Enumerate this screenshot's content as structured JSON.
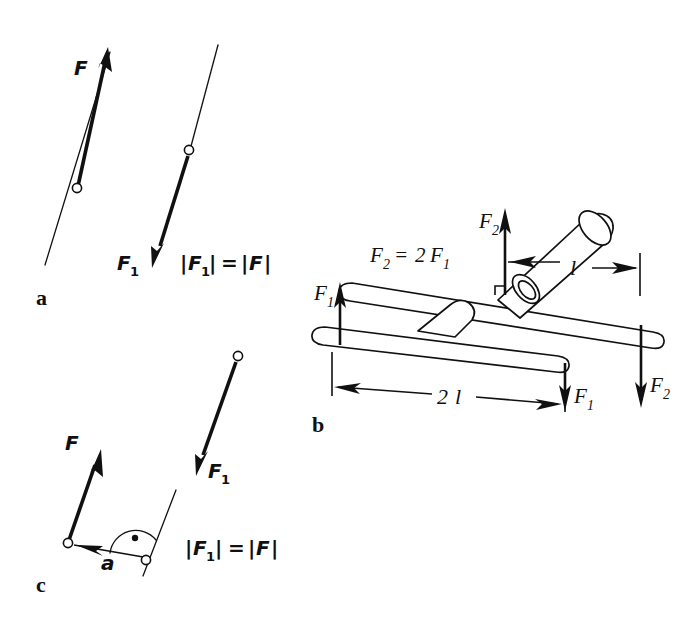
{
  "figure": {
    "background_color": "#ffffff",
    "ink_color": "#101010",
    "width": 695,
    "height": 617
  },
  "panels": [
    {
      "id": "a",
      "letter": "a",
      "description": "Sliding a force vector along its line of action",
      "labels": {
        "force_main": "F",
        "force_shifted": "F",
        "force_shifted_sub": "1",
        "equation": "|F₁| = |F|"
      },
      "equation_parts": {
        "open_bar": "|",
        "lhs_symbol": "F",
        "lhs_sub": "1",
        "close_bar": "|",
        "equals": "=",
        "rhs_symbol": "F"
      }
    },
    {
      "id": "b",
      "letter": "b",
      "description": "Two crossed bars forming force couples of equal moment",
      "labels": {
        "relation_symbol": "F",
        "relation_sub": "2",
        "relation_equals": "=",
        "relation_factor": "2",
        "relation_symbol2": "F",
        "relation_sub2": "1",
        "relation_full": "F₂ = 2 F₁",
        "force_upper": "F",
        "force_upper_sub": "2",
        "force_lower": "F",
        "force_lower_sub": "1",
        "dim_short": "l",
        "dim_long": "2 l",
        "dim_long_number": "2",
        "dim_long_symbol": "l"
      },
      "forces": [
        {
          "name": "F₁",
          "symbol": "F",
          "sub": "1",
          "direction": "up",
          "location": "lower-bar-left"
        },
        {
          "name": "F₁",
          "symbol": "F",
          "sub": "1",
          "direction": "down",
          "location": "lower-bar-right"
        },
        {
          "name": "F₂",
          "symbol": "F",
          "sub": "2",
          "direction": "up",
          "location": "upper-bar-left"
        },
        {
          "name": "F₂",
          "symbol": "F",
          "sub": "2",
          "direction": "down",
          "location": "upper-bar-right"
        }
      ],
      "dimensions": [
        {
          "name": "l",
          "value": "l",
          "applies_to": "upper-bar"
        },
        {
          "name": "2l",
          "value": "2 l",
          "applies_to": "lower-bar"
        }
      ]
    },
    {
      "id": "c",
      "letter": "c",
      "description": "Parallel displacement of a force by offset a with perpendicular marker",
      "labels": {
        "force_main": "F",
        "force_shifted": "F",
        "force_shifted_sub": "1",
        "offset": "a",
        "equation": "|F₁| = |F|"
      },
      "equation_parts": {
        "open_bar": "|",
        "lhs_symbol": "F",
        "lhs_sub": "1",
        "close_bar": "|",
        "equals": "=",
        "rhs_symbol": "F"
      }
    }
  ]
}
